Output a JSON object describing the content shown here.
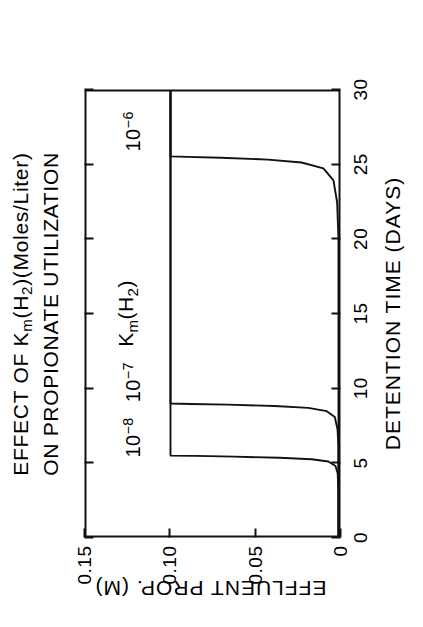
{
  "figure": {
    "title_lines": [
      "EFFECT OF Kₘ(H₂)(Moles/Liter)",
      "ON PROPIONATE UTILIZATION"
    ],
    "title_line1_parts": {
      "a": "EFFECT OF K",
      "m": "m",
      "b": "(H",
      "two": "2",
      "c": ")(Moles/Liter)"
    },
    "title_line2": "ON PROPIONATE UTILIZATION",
    "group_label_parts": {
      "k": "K",
      "m": "m",
      "open": "(H",
      "two": "2",
      "close": ")"
    },
    "group_label_text": "Kₘ(H₂)"
  },
  "chart_data": {
    "type": "line",
    "xlabel": "DETENTION TIME (DAYS)",
    "ylabel": "EFFLUENT PROP. (M)",
    "xlim": [
      0,
      30
    ],
    "ylim": [
      0,
      0.15
    ],
    "xticks": [
      0,
      5,
      10,
      15,
      20,
      25,
      30
    ],
    "xtick_labels": [
      "0",
      "5",
      "10",
      "15",
      "20",
      "25",
      "30"
    ],
    "yticks": [
      0,
      0.05,
      0.1,
      0.15
    ],
    "ytick_labels": [
      "0",
      "0.05",
      "0.10",
      "0.15"
    ],
    "grid": false,
    "legend": "inline-annotations",
    "annotations": [
      {
        "text": "Kₘ(H₂)",
        "x": 15.0,
        "y": 0.125
      },
      {
        "text": "10⁻⁶",
        "x": 27.2,
        "y": 0.122
      },
      {
        "text": "10⁻⁷",
        "x": 10.4,
        "y": 0.122
      },
      {
        "text": "10⁻⁸",
        "x": 6.7,
        "y": 0.122
      }
    ],
    "series": [
      {
        "name": "10⁻⁸",
        "label": "10-8",
        "exponent": "-8",
        "washout_day": 5.4,
        "points": [
          [
            0.0,
            0.0
          ],
          [
            3.0,
            0.0
          ],
          [
            4.2,
            0.0005
          ],
          [
            4.7,
            0.0018
          ],
          [
            5.0,
            0.006
          ],
          [
            5.15,
            0.016
          ],
          [
            5.25,
            0.035
          ],
          [
            5.33,
            0.062
          ],
          [
            5.38,
            0.085
          ],
          [
            5.4,
            0.1
          ],
          [
            30.0,
            0.1
          ]
        ]
      },
      {
        "name": "10⁻⁷",
        "label": "10-7",
        "exponent": "-7",
        "washout_day": 8.9,
        "points": [
          [
            0.0,
            0.0
          ],
          [
            6.0,
            0.0
          ],
          [
            7.2,
            0.0006
          ],
          [
            8.0,
            0.0022
          ],
          [
            8.4,
            0.007
          ],
          [
            8.62,
            0.018
          ],
          [
            8.75,
            0.038
          ],
          [
            8.84,
            0.066
          ],
          [
            8.89,
            0.088
          ],
          [
            8.92,
            0.1
          ],
          [
            30.0,
            0.1
          ]
        ]
      },
      {
        "name": "10⁻⁶",
        "label": "10-6",
        "exponent": "-6",
        "washout_day": 25.6,
        "points": [
          [
            0.0,
            0.0
          ],
          [
            20.0,
            0.0
          ],
          [
            22.5,
            0.0008
          ],
          [
            24.0,
            0.003
          ],
          [
            24.8,
            0.009
          ],
          [
            25.2,
            0.022
          ],
          [
            25.4,
            0.042
          ],
          [
            25.52,
            0.07
          ],
          [
            25.58,
            0.09
          ],
          [
            25.62,
            0.1
          ],
          [
            30.0,
            0.1
          ]
        ]
      }
    ]
  }
}
